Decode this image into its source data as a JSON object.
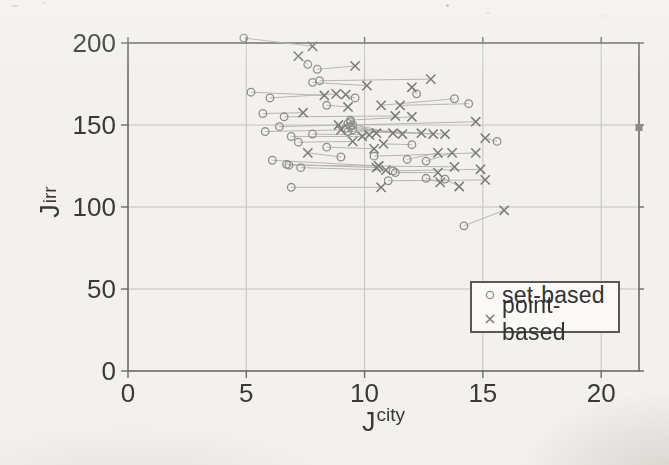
{
  "page": {
    "background": "#f3f1ee"
  },
  "chart_data": {
    "type": "scatter",
    "title": "",
    "xlabel": {
      "base": "J",
      "sup": "city"
    },
    "ylabel": {
      "base": "J",
      "sup": "irr"
    },
    "xlim": [
      0,
      21.6
    ],
    "ylim": [
      0,
      200
    ],
    "xtick_labels": [
      "0",
      "5",
      "10",
      "15",
      "20"
    ],
    "xtick_values": [
      0,
      5,
      10,
      15,
      20
    ],
    "ytick_labels": [
      "0",
      "50",
      "100",
      "150",
      "200"
    ],
    "ytick_values": [
      0,
      50,
      100,
      150,
      200
    ],
    "grid": true,
    "legend": {
      "position": "lower-right",
      "entries": [
        {
          "marker": "circle",
          "label": "set-based"
        },
        {
          "marker": "x",
          "label": "point-based"
        }
      ]
    },
    "pairs": [
      {
        "set": [
          4.9,
          203
        ],
        "point": [
          7.8,
          198
        ]
      },
      {
        "set": [
          7.6,
          187
        ],
        "point": [
          7.2,
          192
        ]
      },
      {
        "set": [
          8.0,
          184
        ],
        "point": [
          9.6,
          186
        ]
      },
      {
        "set": [
          7.8,
          176
        ],
        "point": [
          10.1,
          174
        ]
      },
      {
        "set": [
          8.1,
          177
        ],
        "point": [
          12.8,
          178
        ]
      },
      {
        "set": [
          12.2,
          169
        ],
        "point": [
          12.0,
          173
        ]
      },
      {
        "set": [
          5.2,
          170
        ],
        "point": [
          8.3,
          168
        ]
      },
      {
        "set": [
          6.0,
          166.5
        ],
        "point": [
          8.8,
          169
        ]
      },
      {
        "set": [
          9.6,
          166.5
        ],
        "point": [
          9.2,
          168.5
        ]
      },
      {
        "set": [
          8.4,
          162
        ],
        "point": [
          9.3,
          161
        ]
      },
      {
        "set": [
          13.8,
          166
        ],
        "point": [
          10.7,
          162
        ]
      },
      {
        "set": [
          14.4,
          163
        ],
        "point": [
          11.5,
          162
        ]
      },
      {
        "set": [
          5.7,
          157
        ],
        "point": [
          7.4,
          157.5
        ]
      },
      {
        "set": [
          6.6,
          155
        ],
        "point": [
          11.3,
          155.5
        ]
      },
      {
        "set": [
          9.4,
          153
        ],
        "point": [
          12.0,
          155
        ]
      },
      {
        "set": [
          9.3,
          151
        ],
        "point": [
          11.2,
          145
        ]
      },
      {
        "set": [
          9.4,
          149
        ],
        "point": [
          11.6,
          144.5
        ]
      },
      {
        "set": [
          9.2,
          148
        ],
        "point": [
          12.4,
          145
        ]
      },
      {
        "set": [
          9.5,
          147
        ],
        "point": [
          12.9,
          144.5
        ]
      },
      {
        "set": [
          9.3,
          146
        ],
        "point": [
          13.4,
          144.5
        ]
      },
      {
        "set": [
          9.4,
          152
        ],
        "point": [
          10.5,
          145
        ]
      },
      {
        "set": [
          6.4,
          149
        ],
        "point": [
          8.9,
          150
        ]
      },
      {
        "set": [
          5.8,
          146
        ],
        "point": [
          9.0,
          147
        ]
      },
      {
        "set": [
          7.8,
          144.5
        ],
        "point": [
          10.2,
          144
        ]
      },
      {
        "set": [
          6.9,
          143
        ],
        "point": [
          9.9,
          143
        ]
      },
      {
        "set": [
          12.0,
          138
        ],
        "point": [
          10.8,
          138.5
        ]
      },
      {
        "set": [
          15.6,
          140
        ],
        "point": [
          15.1,
          142
        ]
      },
      {
        "set": [
          7.2,
          139.5
        ],
        "point": [
          9.5,
          140
        ]
      },
      {
        "set": [
          8.4,
          136.5
        ],
        "point": [
          10.4,
          135.5
        ]
      },
      {
        "set": [
          9.0,
          130.5
        ],
        "point": [
          7.6,
          133
        ]
      },
      {
        "set": [
          11.8,
          129
        ],
        "point": [
          13.1,
          133
        ]
      },
      {
        "set": [
          12.6,
          128
        ],
        "point": [
          13.7,
          133
        ]
      },
      {
        "set": [
          10.4,
          131
        ],
        "point": [
          14.7,
          133
        ]
      },
      {
        "set": [
          6.1,
          128.5
        ],
        "point": [
          10.6,
          125
        ]
      },
      {
        "set": [
          6.8,
          125.5
        ],
        "point": [
          13.8,
          124.5
        ]
      },
      {
        "set": [
          7.3,
          124
        ],
        "point": [
          10.9,
          122.5
        ]
      },
      {
        "set": [
          6.7,
          126
        ],
        "point": [
          10.5,
          124
        ]
      },
      {
        "set": [
          11.2,
          122
        ],
        "point": [
          14.9,
          123
        ]
      },
      {
        "set": [
          11.3,
          121
        ],
        "point": [
          13.1,
          121
        ]
      },
      {
        "set": [
          11.0,
          116
        ],
        "point": [
          15.1,
          116.5
        ]
      },
      {
        "set": [
          12.6,
          117.5
        ],
        "point": [
          13.2,
          115
        ]
      },
      {
        "set": [
          13.4,
          117
        ],
        "point": [
          14.0,
          112.5
        ]
      },
      {
        "set": [
          6.9,
          112
        ],
        "point": [
          10.7,
          112
        ]
      },
      {
        "set": [
          9.5,
          150
        ],
        "point": [
          14.7,
          152
        ]
      },
      {
        "set": [
          14.2,
          88.5
        ],
        "point": [
          15.9,
          98
        ]
      }
    ],
    "edge_marker": {
      "marker": "filled-square",
      "x": 21.6,
      "y": 148.5
    },
    "colors": {
      "grid": "#c3c2bf",
      "spine": "#6b6a68",
      "circle_marker": "#8f8e8b",
      "x_marker": "#7a7977",
      "connector": "#b0afac",
      "text": "#3a3938",
      "legend_border": "#595856",
      "legend_bg": "#faf9f7",
      "square": "#8b8a88"
    }
  }
}
